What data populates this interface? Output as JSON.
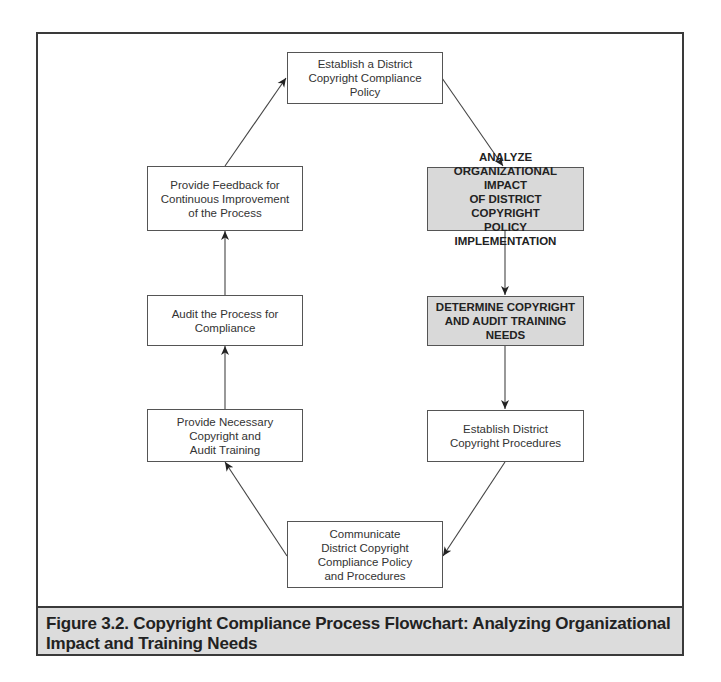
{
  "diagram": {
    "type": "cyclic-flowchart",
    "nodes": [
      {
        "id": "establish-policy",
        "label": "Establish a District\nCopyright Compliance\nPolicy",
        "highlighted": false
      },
      {
        "id": "analyze-impact",
        "label": "ANALYZE\nORGANIZATIONAL IMPACT\nOF DISTRICT COPYRIGHT\nPOLICY IMPLEMENTATION",
        "highlighted": true
      },
      {
        "id": "determine-needs",
        "label": "DETERMINE COPYRIGHT\nAND AUDIT TRAINING\nNEEDS",
        "highlighted": true
      },
      {
        "id": "establish-procedures",
        "label": "Establish District\nCopyright Procedures",
        "highlighted": false
      },
      {
        "id": "communicate",
        "label": "Communicate\nDistrict Copyright\nCompliance Policy\nand Procedures",
        "highlighted": false
      },
      {
        "id": "provide-training",
        "label": "Provide Necessary\nCopyright and\nAudit Training",
        "highlighted": false
      },
      {
        "id": "audit-process",
        "label": "Audit the Process for\nCompliance",
        "highlighted": false
      },
      {
        "id": "provide-feedback",
        "label": "Provide Feedback for\nContinuous Improvement\nof the Process",
        "highlighted": false
      }
    ],
    "edges": [
      {
        "from": "establish-policy",
        "to": "analyze-impact"
      },
      {
        "from": "analyze-impact",
        "to": "determine-needs"
      },
      {
        "from": "determine-needs",
        "to": "establish-procedures"
      },
      {
        "from": "establish-procedures",
        "to": "communicate"
      },
      {
        "from": "communicate",
        "to": "provide-training"
      },
      {
        "from": "provide-training",
        "to": "audit-process"
      },
      {
        "from": "audit-process",
        "to": "provide-feedback"
      },
      {
        "from": "provide-feedback",
        "to": "establish-policy"
      }
    ]
  },
  "caption": "Figure 3.2.  Copyright Compliance Process Flowchart: Analyzing Organizational Impact and Training Needs",
  "colors": {
    "highlight_fill": "#d9d9d9",
    "caption_fill": "#dcdcdc",
    "border": "#3a3a3a"
  }
}
